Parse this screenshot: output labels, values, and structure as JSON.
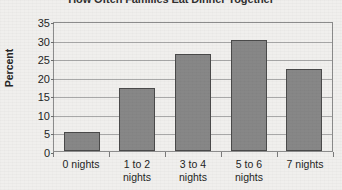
{
  "chart_data": {
    "type": "bar",
    "title": "How Often Families Eat Dinner Together",
    "xlabel": "",
    "ylabel": "Percent",
    "categories": [
      "0 nights",
      "1 to 2 nights",
      "3 to 4 nights",
      "5 to 6 nights",
      "7 nights"
    ],
    "values": [
      5,
      17,
      26,
      30,
      22
    ],
    "ylim": [
      0,
      35
    ],
    "ytick_labels": [
      "0",
      "5",
      "10",
      "15",
      "20",
      "25",
      "30",
      "35"
    ],
    "ytick_values": [
      0,
      5,
      10,
      15,
      20,
      25,
      30,
      35
    ],
    "grid": true,
    "legend": "none",
    "bar_color": "#878787",
    "bar_border_color": "#4a4a4a",
    "axis_color": "#8c8c8c",
    "gridline_color": "#a8a8a8",
    "text_color": "#1f1f1f"
  }
}
